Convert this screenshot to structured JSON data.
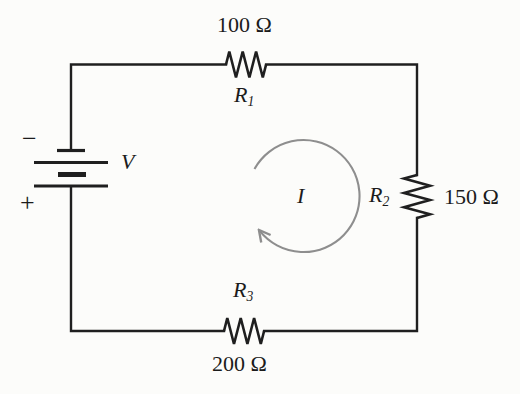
{
  "diagram": {
    "kind": "series-resistive-circuit-schematic",
    "battery": {
      "label": "V",
      "negative_terminal": "−",
      "positive_terminal": "+"
    },
    "current_loop": {
      "label": "I",
      "direction": "clockwise"
    },
    "resistors": [
      {
        "name": "R",
        "subscript": "1",
        "value": "100 Ω",
        "position": "top"
      },
      {
        "name": "R",
        "subscript": "2",
        "value": "150 Ω",
        "position": "right"
      },
      {
        "name": "R",
        "subscript": "3",
        "value": "200 Ω",
        "position": "bottom"
      }
    ],
    "colors": {
      "wire": "#1f1f1f",
      "text": "#1b1b1b",
      "arrow": "#8e8e8e",
      "background": "#fcfcfa"
    }
  }
}
